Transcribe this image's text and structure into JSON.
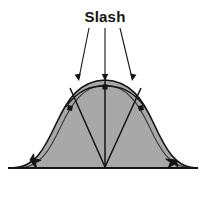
{
  "figure": {
    "type": "annotated-geometric-diagram",
    "canvas": {
      "width": 206,
      "height": 200
    },
    "background_color": "#ffffff",
    "ink_color": "#141414",
    "fill_color": "#a8a8a8",
    "fill_edge_color": "#8f8f8f",
    "labels": [
      {
        "name": "slash-label",
        "text": "Slash",
        "x": 105,
        "y": 22,
        "anchor": "middle",
        "bold": true,
        "font_size": 15
      }
    ],
    "leader_lines": [
      {
        "name": "leader-left",
        "x1": 89,
        "y1": 28,
        "x2": 79,
        "y2": 80
      },
      {
        "name": "leader-center",
        "x1": 105,
        "y1": 28,
        "x2": 105,
        "y2": 80
      },
      {
        "name": "leader-right",
        "x1": 120,
        "y1": 28,
        "x2": 132,
        "y2": 80
      }
    ],
    "leader_arrowheads": [
      {
        "name": "leader-arrowhead-left",
        "x": 79,
        "y": 81,
        "angle": 259
      },
      {
        "name": "leader-arrowhead-center",
        "x": 105,
        "y": 81,
        "angle": 270
      },
      {
        "name": "leader-arrowhead-right",
        "x": 132,
        "y": 81,
        "angle": 281
      }
    ],
    "baseline": {
      "name": "baseline",
      "x1": 8,
      "y1": 168,
      "x2": 198,
      "y2": 168
    },
    "bell_curve": {
      "name": "bell-curve-outer",
      "description": "gray filled bell-shaped dome with tails resting on the baseline",
      "peak_x": 105,
      "peak_y": 78,
      "left_foot_x": 12,
      "right_foot_x": 196,
      "baseline_y": 168
    },
    "inner_arc": {
      "name": "inner-arc",
      "description": "secondary arc just inside the crest of the bell curve",
      "peak_x": 105,
      "peak_y": 86,
      "left_end_x": 70,
      "left_end_y": 104,
      "right_end_x": 141,
      "right_end_y": 104
    },
    "chord_lines": [
      {
        "name": "chord-left",
        "x1": 105,
        "y1": 167,
        "x2": 71,
        "y2": 88
      },
      {
        "name": "chord-right",
        "x1": 105,
        "y1": 167,
        "x2": 140,
        "y2": 88
      },
      {
        "name": "chord-center",
        "x1": 105,
        "y1": 167,
        "x2": 105,
        "y2": 80
      }
    ],
    "square_markers": [
      {
        "name": "square-marker-left-mid",
        "x": 70,
        "y": 108,
        "size": 5
      },
      {
        "name": "square-marker-right-mid",
        "x": 141,
        "y": 108,
        "size": 5
      },
      {
        "name": "square-marker-crest",
        "x": 105,
        "y": 87,
        "size": 5
      }
    ],
    "tail_arrowheads": [
      {
        "name": "tail-arrowhead-left",
        "x": 30,
        "y": 160,
        "angle": 205
      },
      {
        "name": "tail-arrowhead-right",
        "x": 176,
        "y": 160,
        "angle": 335
      }
    ]
  }
}
